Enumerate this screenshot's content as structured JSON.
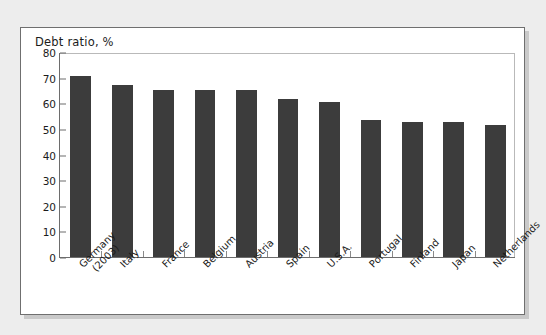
{
  "chart_data": {
    "type": "bar",
    "title": "Debt ratio, %",
    "xlabel": "",
    "ylabel": "",
    "ylim": [
      0,
      80
    ],
    "yticks": [
      0,
      10,
      20,
      30,
      40,
      50,
      60,
      70,
      80
    ],
    "grid": false,
    "legend": null,
    "bar_color": "#3c3c3c",
    "categories": [
      "Germany (2003)",
      "Italy",
      "France",
      "Belgium",
      "Austria",
      "Spain",
      "U.S.A.",
      "Portugal",
      "Finland",
      "Japan",
      "Netherlands"
    ],
    "category_lines": [
      [
        "Germany",
        "(2003)"
      ],
      [
        "Italy",
        ""
      ],
      [
        "France",
        ""
      ],
      [
        "Belgium",
        ""
      ],
      [
        "Austria",
        ""
      ],
      [
        "Spain",
        ""
      ],
      [
        "U.S.A.",
        ""
      ],
      [
        "Portugal",
        ""
      ],
      [
        "Finland",
        ""
      ],
      [
        "Japan",
        ""
      ],
      [
        "Netherlands",
        ""
      ]
    ],
    "values": [
      70.8,
      67.0,
      65.3,
      65.2,
      65.0,
      61.5,
      60.3,
      53.5,
      52.7,
      52.5,
      51.5
    ]
  }
}
